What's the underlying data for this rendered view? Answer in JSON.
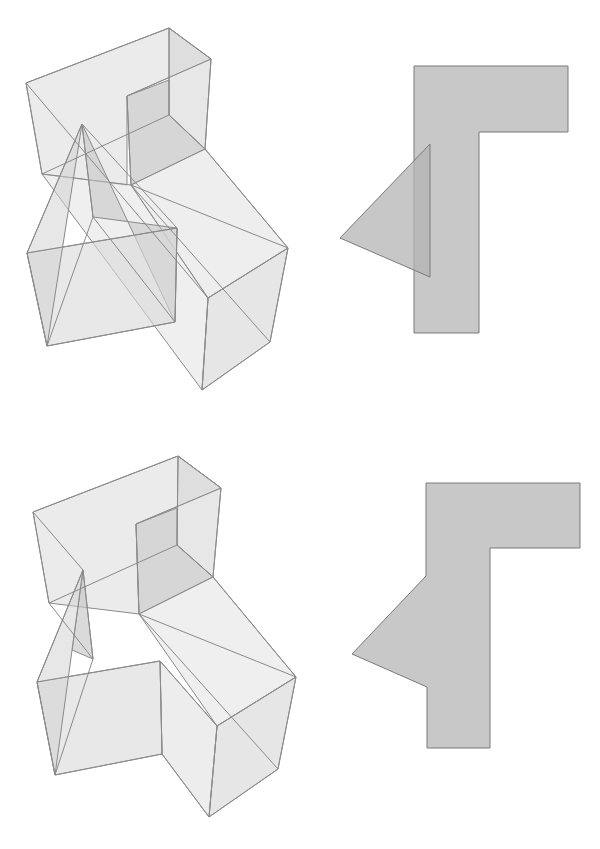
{
  "diagram": {
    "title": "",
    "colors": {
      "background": "#ffffff",
      "solid_face": "#d9d9d9",
      "solid_face_dark": "#bdbdbd",
      "edge": "#8a8a8a",
      "projection_fill": "#c8c8c8",
      "projection_triangle_fill": "#bcbcbc"
    },
    "panels": [
      {
        "id": "top-3d-solid",
        "kind": "3d-solid",
        "description": "Transparent L-shaped box with a separate triangular prism intersecting it"
      },
      {
        "id": "top-2d-projection",
        "kind": "2d-projection",
        "description": "L-shaped silhouette with an overlapping triangle",
        "l_shape": [
          [
            414,
            66
          ],
          [
            568,
            66
          ],
          [
            568,
            132
          ],
          [
            479,
            132
          ],
          [
            479,
            333
          ],
          [
            414,
            333
          ]
        ],
        "triangle": [
          [
            430,
            144
          ],
          [
            340,
            238
          ],
          [
            430,
            277
          ]
        ]
      },
      {
        "id": "bottom-3d-solid",
        "kind": "3d-solid",
        "description": "Transparent L-shaped box merged with a triangular prism"
      },
      {
        "id": "bottom-2d-projection",
        "kind": "2d-projection",
        "description": "Combined L-shaped silhouette with a triangular notch",
        "outline": [
          [
            426,
            483
          ],
          [
            580,
            483
          ],
          [
            580,
            548
          ],
          [
            490,
            548
          ],
          [
            490,
            748
          ],
          [
            427,
            748
          ],
          [
            427,
            687
          ],
          [
            352,
            654
          ],
          [
            426,
            576
          ]
        ]
      }
    ]
  }
}
